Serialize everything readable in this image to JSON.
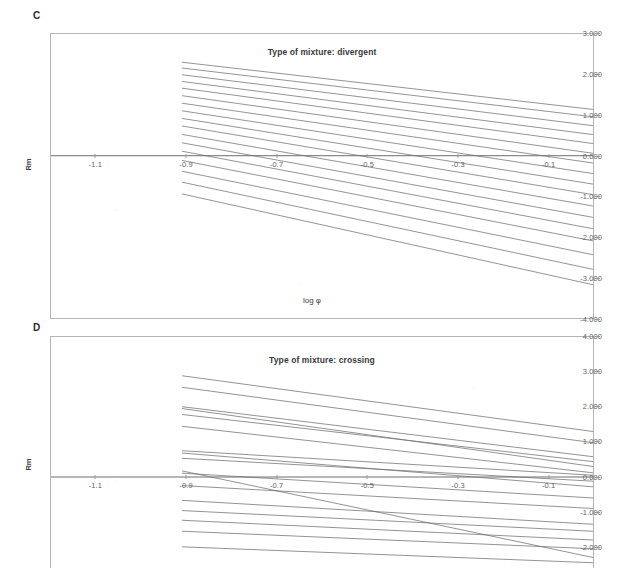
{
  "figure": {
    "background_color": "#ffffff",
    "line_color": "#6e6e70",
    "axis_color": "#b4b4b4",
    "text_color": "#4a4a4a"
  },
  "panels": [
    {
      "label": "C",
      "title": "Type of mixture: divergent",
      "xlabel": "log φ",
      "ylabel": "Rm",
      "xticks": [
        "-1.1",
        "-0.9",
        "-0.7",
        "-0.5",
        "-0.3",
        "-0.1"
      ],
      "yticks": [
        "3.000",
        "2.000",
        "1.000",
        "0.000",
        "-1.000",
        "-2.000",
        "-3.000",
        "-4.000"
      ]
    },
    {
      "label": "D",
      "title": "Type of mixture: crossing",
      "xlabel": "log φ",
      "ylabel": "Rm",
      "xticks": [
        "-1.1",
        "-0.9",
        "-0.7",
        "-0.5",
        "-0.3",
        "-0.1"
      ],
      "yticks": [
        "4.000",
        "3.000",
        "2.000",
        "1.000",
        "0.000",
        "-1.000",
        "-2.000"
      ]
    }
  ],
  "chart_data": [
    {
      "type": "line",
      "panel": "C",
      "title": "Type of mixture: divergent",
      "xlabel": "log φ",
      "ylabel": "Rm",
      "xlim": [
        -1.2,
        0.0
      ],
      "ylim": [
        -4.0,
        3.0
      ],
      "xticks": [
        -1.1,
        -0.9,
        -0.7,
        -0.5,
        -0.3,
        -0.1
      ],
      "yticks": [
        3.0,
        2.0,
        1.0,
        0.0,
        -1.0,
        -2.0,
        -3.0,
        -4.0
      ],
      "grid": false,
      "legend": "none",
      "reference_line_y": 0.0,
      "note": "Fan of straight regression lines, all negative slope, diverging toward the right (larger log phi).",
      "series": [
        {
          "name": "line-1",
          "x": [
            -1.0,
            0.0
          ],
          "y": [
            2.42,
            1.14
          ]
        },
        {
          "name": "line-2",
          "x": [
            -1.0,
            0.0
          ],
          "y": [
            2.28,
            0.96
          ]
        },
        {
          "name": "line-3",
          "x": [
            -1.0,
            0.0
          ],
          "y": [
            2.12,
            0.74
          ]
        },
        {
          "name": "line-4",
          "x": [
            -1.0,
            0.0
          ],
          "y": [
            1.96,
            0.52
          ]
        },
        {
          "name": "line-5",
          "x": [
            -1.0,
            0.0
          ],
          "y": [
            1.8,
            0.3
          ]
        },
        {
          "name": "line-6",
          "x": [
            -1.0,
            0.0
          ],
          "y": [
            1.62,
            0.06
          ]
        },
        {
          "name": "line-7",
          "x": [
            -1.0,
            0.0
          ],
          "y": [
            1.44,
            -0.18
          ]
        },
        {
          "name": "line-8",
          "x": [
            -1.0,
            0.0
          ],
          "y": [
            1.26,
            -0.44
          ]
        },
        {
          "name": "line-9",
          "x": [
            -1.0,
            0.0
          ],
          "y": [
            1.08,
            -0.7
          ]
        },
        {
          "name": "line-10",
          "x": [
            -1.0,
            0.0
          ],
          "y": [
            0.9,
            -0.96
          ]
        },
        {
          "name": "line-11",
          "x": [
            -1.0,
            0.0
          ],
          "y": [
            0.7,
            -1.24
          ]
        },
        {
          "name": "line-12",
          "x": [
            -1.0,
            0.0
          ],
          "y": [
            0.5,
            -1.52
          ]
        },
        {
          "name": "line-13",
          "x": [
            -1.0,
            0.0
          ],
          "y": [
            0.3,
            -1.8
          ]
        },
        {
          "name": "line-14",
          "x": [
            -1.0,
            0.0
          ],
          "y": [
            0.08,
            -2.1
          ]
        },
        {
          "name": "line-15",
          "x": [
            -1.0,
            0.0
          ],
          "y": [
            -0.18,
            -2.44
          ]
        },
        {
          "name": "line-16",
          "x": [
            -1.0,
            0.0
          ],
          "y": [
            -0.44,
            -2.8
          ]
        },
        {
          "name": "line-17",
          "x": [
            -1.0,
            0.0
          ],
          "y": [
            -0.72,
            -3.18
          ]
        }
      ]
    },
    {
      "type": "line",
      "panel": "D",
      "title": "Type of mixture: crossing",
      "xlabel": "log φ",
      "ylabel": "Rm",
      "xlim": [
        -1.2,
        0.0
      ],
      "ylim": [
        -2.6,
        4.0
      ],
      "xticks": [
        -1.1,
        -0.9,
        -0.7,
        -0.5,
        -0.3,
        -0.1
      ],
      "yticks": [
        4.0,
        3.0,
        2.0,
        1.0,
        0.0,
        -1.0,
        -2.0
      ],
      "grid": false,
      "legend": "none",
      "reference_line_y": 0.0,
      "note": "Straight regression lines with differing slopes that intersect one another (crossing pattern).",
      "series": [
        {
          "name": "line-1",
          "x": [
            -1.0,
            0.0
          ],
          "y": [
            3.05,
            1.3
          ]
        },
        {
          "name": "line-2",
          "x": [
            -1.0,
            0.0
          ],
          "y": [
            2.72,
            0.98
          ]
        },
        {
          "name": "line-3",
          "x": [
            -1.0,
            0.0
          ],
          "y": [
            2.15,
            0.58
          ]
        },
        {
          "name": "line-4",
          "x": [
            -1.0,
            0.0
          ],
          "y": [
            2.12,
            0.3
          ]
        },
        {
          "name": "line-5",
          "x": [
            -1.0,
            0.0
          ],
          "y": [
            1.92,
            0.44
          ]
        },
        {
          "name": "line-6",
          "x": [
            -1.0,
            0.0
          ],
          "y": [
            1.58,
            0.12
          ]
        },
        {
          "name": "line-7",
          "x": [
            -1.0,
            0.0
          ],
          "y": [
            0.82,
            0.05
          ]
        },
        {
          "name": "line-8",
          "x": [
            -1.0,
            0.0
          ],
          "y": [
            0.78,
            -0.28
          ]
        },
        {
          "name": "line-9",
          "x": [
            -1.0,
            0.0
          ],
          "y": [
            0.6,
            -0.12
          ]
        },
        {
          "name": "line-10",
          "x": [
            -1.0,
            0.0
          ],
          "y": [
            0.42,
            -2.3
          ]
        },
        {
          "name": "line-11",
          "x": [
            -1.0,
            0.0
          ],
          "y": [
            0.18,
            -0.6
          ]
        },
        {
          "name": "line-12",
          "x": [
            -1.0,
            0.0
          ],
          "y": [
            -0.18,
            -0.9
          ]
        },
        {
          "name": "line-13",
          "x": [
            -1.0,
            0.0
          ],
          "y": [
            -0.6,
            -1.35
          ]
        },
        {
          "name": "line-14",
          "x": [
            -1.0,
            0.0
          ],
          "y": [
            -0.9,
            -1.55
          ]
        },
        {
          "name": "line-15",
          "x": [
            -1.0,
            0.0
          ],
          "y": [
            -1.18,
            -1.8
          ]
        },
        {
          "name": "line-16",
          "x": [
            -1.0,
            0.0
          ],
          "y": [
            -1.5,
            -2.05
          ]
        },
        {
          "name": "line-17",
          "x": [
            -1.0,
            0.0
          ],
          "y": [
            -1.95,
            -2.45
          ]
        }
      ]
    }
  ]
}
